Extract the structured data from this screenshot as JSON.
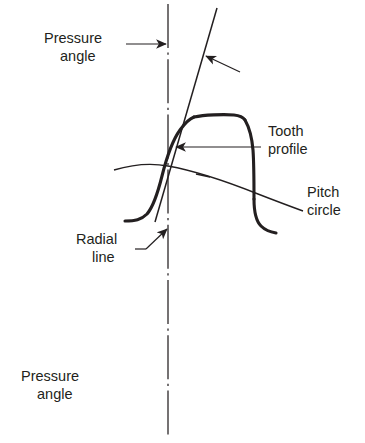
{
  "figure": {
    "background_color": "#ffffff",
    "line_color": "#231f20",
    "text_color": "#231f20"
  },
  "labels": {
    "pressure_angle_top": {
      "line1": "Pressure",
      "line2": "angle"
    },
    "pressure_angle_bottom": {
      "line1": "Pressure",
      "line2": "angle"
    },
    "tooth_profile": {
      "line1": "Tooth",
      "line2": "profile"
    },
    "pitch_circle": {
      "line1": "Pitch",
      "line2": "circle"
    },
    "radial_line": {
      "line1": "Radial",
      "line2": "line"
    }
  },
  "elements": {
    "radial_centerline_name": "radial-line",
    "pressure_line_name": "pressure-angle-line",
    "pitch_circle_name": "pitch-circle-arc",
    "tooth_profile_name": "tooth-profile-outline"
  }
}
